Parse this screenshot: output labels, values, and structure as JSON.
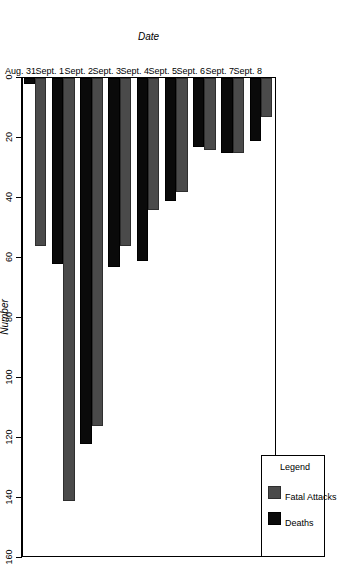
{
  "chart_data": {
    "type": "bar",
    "orientation": "horizontal-rotated",
    "title": "",
    "xlabel": "Date",
    "ylabel": "Number",
    "ylim": [
      0,
      160
    ],
    "ytick_step": 20,
    "grid": false,
    "legend_position": "top-left",
    "legend_title": "Legend",
    "categories": [
      "Aug. 31",
      "Sept. 1",
      "Sept. 2",
      "Sept. 3",
      "Sept. 4",
      "Sept. 5",
      "Sept. 6",
      "Sept. 7",
      "Sept. 8"
    ],
    "yticks": [
      0,
      20,
      40,
      60,
      80,
      100,
      120,
      140,
      160
    ],
    "series": [
      {
        "name": "Fatal Attacks",
        "color": "#4a4a4a",
        "values": [
          56,
          141,
          116,
          56,
          44,
          38,
          24,
          25,
          13
        ]
      },
      {
        "name": "Deaths",
        "color": "#0a0a0a",
        "values": [
          2,
          62,
          122,
          63,
          61,
          41,
          23,
          25,
          21
        ]
      }
    ]
  },
  "legend": {
    "title": "Legend",
    "items": [
      {
        "label": "Fatal Attacks",
        "color": "#4a4a4a"
      },
      {
        "label": "Deaths",
        "color": "#0a0a0a"
      }
    ]
  },
  "axes": {
    "value_axis_title": "Number",
    "category_axis_title": "Date",
    "value_ticks": [
      "160",
      "140",
      "120",
      "100",
      "80",
      "60",
      "40",
      "20",
      "0"
    ],
    "category_ticks": [
      "Aug. 31",
      "Sept. 1",
      "Sept. 2",
      "Sept. 3",
      "Sept. 4",
      "Sept. 5",
      "Sept. 6",
      "Sept. 7",
      "Sept. 8"
    ]
  }
}
